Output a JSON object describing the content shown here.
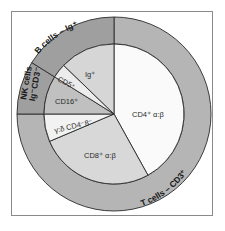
{
  "diagram": {
    "type": "nested-pie",
    "center": [
      114,
      114
    ],
    "inner_radius": 70,
    "outer_radius": 97,
    "outer_ring": [
      {
        "id": "t-cells",
        "label": "T cells – CD3⁺",
        "start_deg": 0,
        "end_deg": 270,
        "color": "#b5b5b5"
      },
      {
        "id": "nk-cells",
        "label_line1": "NK cells",
        "label_line2": "Ig⁻CD3⁻",
        "start_deg": 270,
        "end_deg": 302,
        "color": "#9f9f9f"
      },
      {
        "id": "b-cells",
        "label": "B cells – Ig⁺",
        "start_deg": 302,
        "end_deg": 360,
        "color": "#9f9f9f"
      }
    ],
    "inner_pie": [
      {
        "id": "cd4",
        "label": "CD4⁺ α:β",
        "start_deg": 0,
        "end_deg": 151,
        "color": "#fafafa"
      },
      {
        "id": "cd8",
        "label": "CD8⁺ α:β",
        "start_deg": 151,
        "end_deg": 247,
        "color": "#d8d8d8"
      },
      {
        "id": "gamma-delta",
        "label": "γ:δ CD4⁻8⁻",
        "start_deg": 247,
        "end_deg": 270,
        "color": "#f2f2f2"
      },
      {
        "id": "cd16",
        "label": "CD16⁺",
        "start_deg": 270,
        "end_deg": 302,
        "color": "#c0c0c0"
      },
      {
        "id": "cd5",
        "label": "CD5⁺",
        "start_deg": 302,
        "end_deg": 314,
        "color": "#ececec"
      },
      {
        "id": "ig",
        "label": "Ig⁺",
        "start_deg": 314,
        "end_deg": 360,
        "color": "#d6d6d6"
      }
    ],
    "line_color": "#2a2a2a",
    "frame_color": "#8a8a8a"
  }
}
